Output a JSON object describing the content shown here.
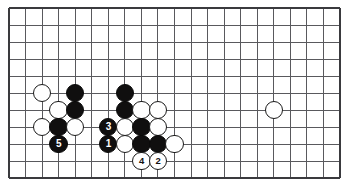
{
  "figure": {
    "kind": "go-board-diagram",
    "width": 347,
    "height": 189,
    "background_color": "#ffffff"
  },
  "board": {
    "columns": 21,
    "rows": 11,
    "origin_x": 9,
    "origin_y": 8,
    "spacing_x": 16.55,
    "spacing_y": 17.0,
    "line_color": "#59595d",
    "line_width": 1,
    "border_color": "#3a3a3e",
    "border_width": 2,
    "border_sides": "left-bottom-right-top",
    "stone_radius": 9.2,
    "edge_note": "bottom edge of board is the board's bottom boundary line"
  },
  "colors": {
    "black_stone": "#100f0f",
    "white_stone": "#ffffff",
    "stone_outline": "#1a1a1a",
    "black_label_text": "#ffffff",
    "white_label_text": "#111111"
  },
  "stones": [
    {
      "id": "w-c3r6",
      "color": "white",
      "col": 3,
      "row": 6,
      "label": ""
    },
    {
      "id": "b-c5r6",
      "color": "black",
      "col": 5,
      "row": 6,
      "label": ""
    },
    {
      "id": "b-c8r6",
      "color": "black",
      "col": 8,
      "row": 6,
      "label": ""
    },
    {
      "id": "w-c4r7",
      "color": "white",
      "col": 4,
      "row": 7,
      "label": ""
    },
    {
      "id": "b-c5r7",
      "color": "black",
      "col": 5,
      "row": 7,
      "label": ""
    },
    {
      "id": "b-c8r7",
      "color": "black",
      "col": 8,
      "row": 7,
      "label": ""
    },
    {
      "id": "w-c9r7",
      "color": "white",
      "col": 9,
      "row": 7,
      "label": ""
    },
    {
      "id": "w-c10r7",
      "color": "white",
      "col": 10,
      "row": 7,
      "label": ""
    },
    {
      "id": "w-c17r7",
      "color": "white",
      "col": 17,
      "row": 7,
      "label": ""
    },
    {
      "id": "w-c3r8",
      "color": "white",
      "col": 3,
      "row": 8,
      "label": ""
    },
    {
      "id": "b-c4r8",
      "color": "black",
      "col": 4,
      "row": 8,
      "label": ""
    },
    {
      "id": "w-c5r8",
      "color": "white",
      "col": 5,
      "row": 8,
      "label": ""
    },
    {
      "id": "b-c7r8",
      "color": "black",
      "col": 7,
      "row": 8,
      "label": "3"
    },
    {
      "id": "w-c8r8",
      "color": "white",
      "col": 8,
      "row": 8,
      "label": ""
    },
    {
      "id": "b-c9r8",
      "color": "black",
      "col": 9,
      "row": 8,
      "label": ""
    },
    {
      "id": "w-c10r8",
      "color": "white",
      "col": 10,
      "row": 8,
      "label": ""
    },
    {
      "id": "b-c4r9",
      "color": "black",
      "col": 4,
      "row": 9,
      "label": "5"
    },
    {
      "id": "b-c7r9",
      "color": "black",
      "col": 7,
      "row": 9,
      "label": "1"
    },
    {
      "id": "w-c8r9",
      "color": "white",
      "col": 8,
      "row": 9,
      "label": ""
    },
    {
      "id": "b-c9r9",
      "color": "black",
      "col": 9,
      "row": 9,
      "label": ""
    },
    {
      "id": "b-c10r9",
      "color": "black",
      "col": 10,
      "row": 9,
      "label": ""
    },
    {
      "id": "w-c11r9",
      "color": "white",
      "col": 11,
      "row": 9,
      "label": ""
    },
    {
      "id": "w-c9r10",
      "color": "white",
      "col": 9,
      "row": 10,
      "label": "4"
    },
    {
      "id": "w-c10r10",
      "color": "white",
      "col": 10,
      "row": 10,
      "label": "2"
    }
  ],
  "move_sequence": [
    {
      "number": "1",
      "color": "black",
      "col": 7,
      "row": 9
    },
    {
      "number": "2",
      "color": "white",
      "col": 10,
      "row": 10
    },
    {
      "number": "3",
      "color": "black",
      "col": 7,
      "row": 8
    },
    {
      "number": "4",
      "color": "white",
      "col": 9,
      "row": 10
    },
    {
      "number": "5",
      "color": "black",
      "col": 4,
      "row": 9
    }
  ]
}
